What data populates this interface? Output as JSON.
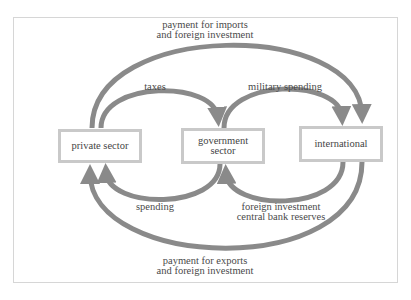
{
  "diagram": {
    "nodes": {
      "private": {
        "label": "private sector"
      },
      "government": {
        "label_line1": "government",
        "label_line2": "sector"
      },
      "international": {
        "label": "international"
      }
    },
    "flows": {
      "imports": {
        "line1": "payment for imports",
        "line2": "and foreign investment",
        "from": "private sector",
        "to": "international"
      },
      "taxes": {
        "label": "taxes",
        "from": "private sector",
        "to": "government sector"
      },
      "military": {
        "label": "military spending",
        "from": "government sector",
        "to": "international"
      },
      "spending": {
        "label": "spending",
        "from": "government sector",
        "to": "private sector"
      },
      "foreign": {
        "line1": "foreign investment",
        "line2": "central bank reserves",
        "from": "international",
        "to": "government sector"
      },
      "exports": {
        "line1": "payment for exports",
        "line2": "and foreign investment",
        "from": "international",
        "to": "private sector"
      }
    },
    "colors": {
      "arrow": "#8a8a8a",
      "box_border": "#c9c9c9",
      "text": "#4a4a4a"
    }
  }
}
